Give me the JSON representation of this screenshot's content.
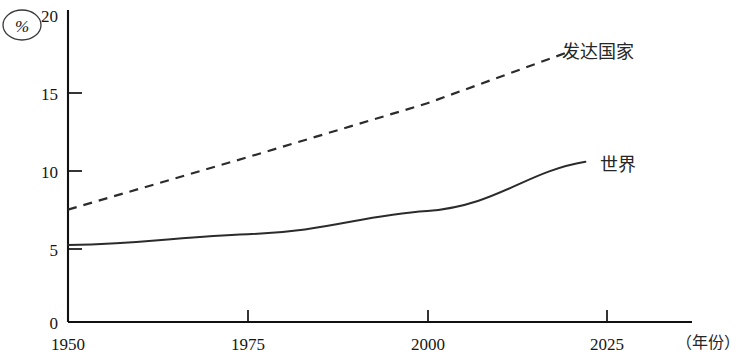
{
  "chart_data": {
    "type": "line",
    "title": "",
    "subtitle": "",
    "xlabel": "（年份）",
    "ylabel": "%",
    "x": [
      1950,
      1975,
      2000,
      2025
    ],
    "xlim": [
      1950,
      2037
    ],
    "ylim": [
      0,
      20
    ],
    "xticks": [
      "1950",
      "1975",
      "2000",
      "2025"
    ],
    "yticks": [
      "0",
      "5",
      "10",
      "15",
      "20"
    ],
    "grid": false,
    "legend_position": "inline-right-of-line-end",
    "series": [
      {
        "name": "发达国家",
        "style": "dashed",
        "color": "#2b2b2b",
        "x": [
          1950,
          1975,
          2000,
          2020
        ],
        "values": [
          7.3,
          10.7,
          14.2,
          17.6
        ]
      },
      {
        "name": "世界",
        "style": "solid",
        "color": "#2b2b2b",
        "x": [
          1950,
          1975,
          2000,
          2022
        ],
        "values": [
          5.0,
          5.7,
          7.2,
          10.4
        ]
      }
    ],
    "annotations": [
      {
        "text": "发达国家",
        "attached_to": "发达国家"
      },
      {
        "text": "世界",
        "attached_to": "世界"
      }
    ]
  },
  "axes": {
    "y_unit_label": "%",
    "y_tick_labels": [
      "20",
      "15",
      "10",
      "5",
      "0"
    ],
    "x_tick_labels": [
      "1950",
      "1975",
      "2000",
      "2025"
    ],
    "x_axis_title": "（年份）"
  },
  "labels": {
    "developed": "发达国家",
    "world": "世界"
  },
  "colors": {
    "line": "#2b2b2b",
    "axis": "#111111",
    "text": "#161616",
    "background": "#ffffff"
  }
}
